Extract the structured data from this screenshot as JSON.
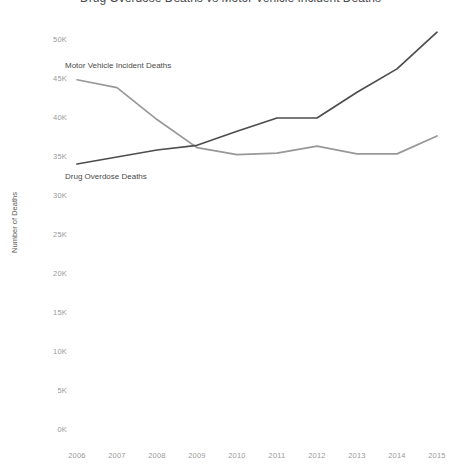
{
  "chart_data": {
    "type": "line",
    "title": "Drug Overdose Deaths vs Motor Vehicle Incident Deaths",
    "xlabel": "",
    "ylabel": "Number of Deaths",
    "x": [
      2006,
      2007,
      2008,
      2009,
      2010,
      2011,
      2012,
      2013,
      2014,
      2015
    ],
    "categories": [
      "2006",
      "2007",
      "2008",
      "2009",
      "2010",
      "2011",
      "2012",
      "2013",
      "2014",
      "2015"
    ],
    "xlim": [
      2006,
      2015
    ],
    "ylim": [
      0,
      50000
    ],
    "yticks": [
      0,
      5000,
      10000,
      15000,
      20000,
      25000,
      30000,
      35000,
      40000,
      45000,
      50000
    ],
    "ytick_labels": [
      "0K",
      "5K",
      "10K",
      "15K",
      "20K",
      "25K",
      "30K",
      "35K",
      "40K",
      "45K",
      "50K"
    ],
    "grid": false,
    "legend_position": "inline-labels",
    "series": [
      {
        "name": "Motor Vehicle Incident Deaths",
        "color": "#989898",
        "values": [
          44900,
          43900,
          39800,
          36200,
          35300,
          35500,
          36400,
          35400,
          35400,
          37700
        ]
      },
      {
        "name": "Drug Overdose Deaths",
        "color": "#4d4d4d",
        "values": [
          34100,
          35000,
          35900,
          36500,
          38300,
          40000,
          40000,
          43300,
          46300,
          51000
        ]
      }
    ],
    "annotations": [
      {
        "text": "Motor Vehicle Incident Deaths",
        "x": 2006,
        "y": 46600
      },
      {
        "text": "Drug Overdose Deaths",
        "x": 2006,
        "y": 32300
      }
    ]
  },
  "axis": {
    "y_title": "Number of Deaths"
  }
}
